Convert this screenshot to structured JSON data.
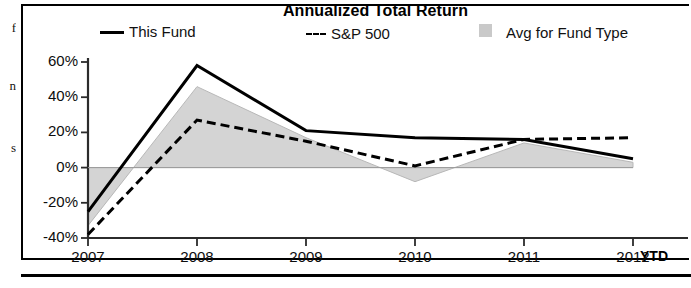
{
  "chart_data": {
    "type": "line",
    "title": "Annualized Total Return",
    "xlabel": "",
    "ylabel": "",
    "categories": [
      "2007",
      "2008",
      "2009",
      "2010",
      "2011",
      "2012"
    ],
    "x_axis_note": "YTD",
    "ylim": [
      -40,
      60
    ],
    "ytick_labels": [
      "60%",
      "40%",
      "20%",
      "0%",
      "-20%",
      "-40%"
    ],
    "ytick_values": [
      60,
      40,
      20,
      0,
      -20,
      -40
    ],
    "grid": false,
    "legend_position": "top",
    "series": [
      {
        "name": "This Fund",
        "style": "solid-line",
        "color": "#000000",
        "values": [
          -25,
          58,
          21,
          17,
          16,
          5
        ]
      },
      {
        "name": "S&P 500",
        "style": "dashed-line",
        "color": "#000000",
        "values": [
          -38,
          27,
          15,
          1,
          16,
          17
        ]
      },
      {
        "name": "Avg for Fund Type",
        "style": "shaded-area",
        "color": "#d4d4d4",
        "values": [
          -33,
          46,
          17,
          -8,
          14,
          3
        ]
      }
    ]
  },
  "legend": {
    "fund_label": "This Fund",
    "sp_label": "S&P 500",
    "avg_label": "Avg for Fund Type"
  },
  "edge_fragments": [
    "f",
    "n",
    "s"
  ],
  "colors": {
    "line": "#000000",
    "area_fill": "#d4d4d4",
    "axis": "#333333",
    "background": "#ffffff"
  }
}
